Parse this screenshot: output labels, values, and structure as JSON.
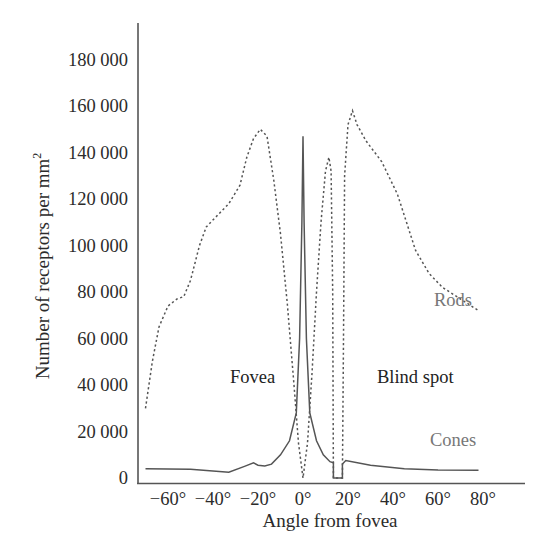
{
  "chart_data": {
    "type": "line",
    "title": "",
    "xlabel": "Angle from fovea",
    "ylabel": "Number of receptors per mm²",
    "ylabel_main": "Number of receptors per mm",
    "ylabel_sup": "2",
    "xlim": [
      -70,
      90
    ],
    "ylim": [
      0,
      190000
    ],
    "grid": false,
    "legend": "inline labels",
    "x_ticks": [
      -60,
      -40,
      -20,
      0,
      20,
      40,
      60,
      80
    ],
    "x_tick_labels": [
      "−60°",
      "−40°",
      "−20°",
      "0°",
      "20°",
      "40°",
      "60°",
      "80°"
    ],
    "y_ticks": [
      0,
      20000,
      40000,
      60000,
      80000,
      100000,
      120000,
      140000,
      160000,
      180000
    ],
    "y_tick_labels": [
      "0",
      "20 000",
      "40 000",
      "60 000",
      "80 000",
      "100 000",
      "120 000",
      "140 000",
      "160 000",
      "180 000"
    ],
    "series": [
      {
        "name": "Rods",
        "style": "dotted",
        "color": "#555555",
        "points": [
          [
            -70,
            30000
          ],
          [
            -67,
            50000
          ],
          [
            -64,
            65000
          ],
          [
            -60,
            74000
          ],
          [
            -56,
            77000
          ],
          [
            -53,
            78000
          ],
          [
            -50,
            85000
          ],
          [
            -46,
            100000
          ],
          [
            -43,
            108000
          ],
          [
            -38,
            113000
          ],
          [
            -33,
            118000
          ],
          [
            -28,
            126000
          ],
          [
            -25,
            138000
          ],
          [
            -22,
            146000
          ],
          [
            -19,
            150000
          ],
          [
            -16,
            147000
          ],
          [
            -13,
            128000
          ],
          [
            -10,
            105000
          ],
          [
            -7,
            75000
          ],
          [
            -4,
            40000
          ],
          [
            -2,
            15000
          ],
          [
            0,
            0
          ],
          [
            2,
            15000
          ],
          [
            4,
            45000
          ],
          [
            6,
            80000
          ],
          [
            8,
            110000
          ],
          [
            10,
            132000
          ],
          [
            11.5,
            138000
          ],
          [
            12.5,
            132000
          ],
          [
            13.2,
            80000
          ],
          [
            13.5,
            0
          ],
          [
            17.5,
            0
          ],
          [
            18,
            60000
          ],
          [
            18.5,
            130000
          ],
          [
            20,
            152000
          ],
          [
            22,
            158000
          ],
          [
            24,
            152000
          ],
          [
            28,
            145000
          ],
          [
            35,
            136000
          ],
          [
            42,
            122000
          ],
          [
            46,
            110000
          ],
          [
            50,
            98000
          ],
          [
            56,
            88000
          ],
          [
            62,
            82000
          ],
          [
            70,
            77000
          ],
          [
            78,
            72000
          ]
        ]
      },
      {
        "name": "Cones",
        "style": "solid",
        "color": "#555555",
        "points": [
          [
            -70,
            4000
          ],
          [
            -50,
            3800
          ],
          [
            -33,
            2500
          ],
          [
            -26,
            5000
          ],
          [
            -22,
            6500
          ],
          [
            -20,
            5500
          ],
          [
            -17,
            5200
          ],
          [
            -14,
            6000
          ],
          [
            -10,
            10000
          ],
          [
            -6,
            16000
          ],
          [
            -3,
            28000
          ],
          [
            -1.5,
            60000
          ],
          [
            -0.5,
            110000
          ],
          [
            0,
            147000
          ],
          [
            0.5,
            110000
          ],
          [
            1.5,
            60000
          ],
          [
            3,
            28000
          ],
          [
            6,
            16000
          ],
          [
            9,
            10000
          ],
          [
            12,
            7000
          ],
          [
            13.5,
            6500
          ],
          [
            13.5,
            0
          ],
          [
            17.5,
            0
          ],
          [
            17.5,
            6000
          ],
          [
            19,
            7500
          ],
          [
            30,
            5500
          ],
          [
            45,
            4000
          ],
          [
            60,
            3500
          ],
          [
            78,
            3300
          ]
        ]
      }
    ],
    "annotations": [
      {
        "text": "Fovea",
        "x": -12,
        "y": 40000
      },
      {
        "text": "Blind spot",
        "x": 34,
        "y": 40000
      },
      {
        "text": "Rods",
        "x": 65,
        "y": 78000
      },
      {
        "text": "Cones",
        "x": 62,
        "y": 18000
      }
    ]
  },
  "labels": {
    "fovea": "Fovea",
    "blind_spot": "Blind spot",
    "rods": "Rods",
    "cones": "Cones",
    "x_axis_title": "Angle from fovea",
    "y_axis_title": "Number of receptors per mm",
    "y_axis_sup": "2"
  }
}
